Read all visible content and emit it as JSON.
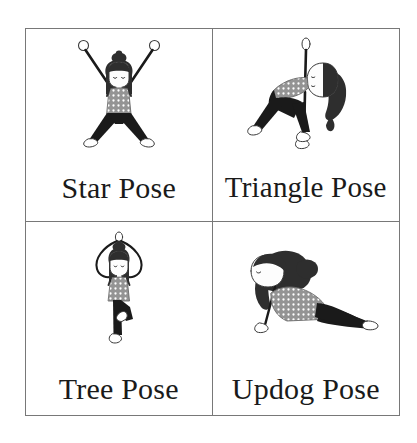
{
  "poster": {
    "title": "Yoga Poses Flashcard Grid",
    "background_color": "#ffffff",
    "border_color": "#787878",
    "layout": "2x2 grid"
  },
  "palette": {
    "ink": "#1a1a1a",
    "hair_dark": "#333333",
    "shirt_gray": "#949494",
    "shirt_dot": "#ffffff",
    "pants_black": "#1a1a1a",
    "skin_white": "#fdfdfd",
    "outline": "#3a3a3a",
    "label_text": "#1a1a1a"
  },
  "cells": [
    {
      "id": "star-pose",
      "label": "Star Pose",
      "position": "top-left",
      "figure": "standing figure with arms raised in V and legs spread wide, hair bun, polka dot shirt, black leggings"
    },
    {
      "id": "triangle-pose",
      "label": "Triangle Pose",
      "position": "top-right",
      "figure": "side bend figure with one arm extended up and one arm down to floor, long hair, polka dot shirt, black leggings"
    },
    {
      "id": "tree-pose",
      "label": "Tree Pose",
      "position": "bottom-left",
      "figure": "standing on one leg with other foot on inner thigh, arms overhead in prayer, hair bun, polka dot shirt, black leggings"
    },
    {
      "id": "updog-pose",
      "label": "Updog Pose",
      "position": "bottom-right",
      "figure": "prone backbend with arms straight and chest lifted, long flowing hair, polka dot shirt, black leggings"
    }
  ]
}
